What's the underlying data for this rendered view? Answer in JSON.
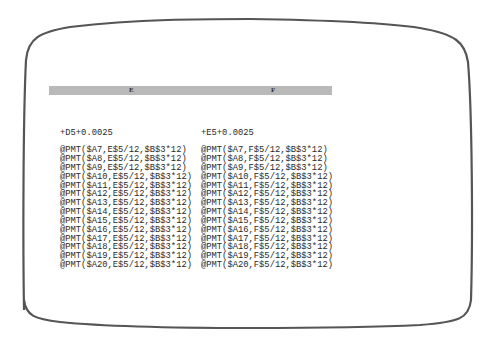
{
  "screen": {
    "bezel_color": "#555555",
    "header_bar_color": "#b9b9b9"
  },
  "columns": {
    "E": {
      "label": "E",
      "first": "+D5+0.0025",
      "rows": [
        "@PMT($A7,E$5/12,$B$3*12)",
        "@PMT($A8,E$5/12,$B$3*12)",
        "@PMT($A9,E$5/12,$B$3*12)",
        "@PMT($A10,E$5/12,$B$3*12)",
        "@PMT($A11,E$5/12,$B$3*12)",
        "@PMT($A12,E$5/12,$B$3*12)",
        "@PMT($A13,E$5/12,$B$3*12)",
        "@PMT($A14,E$5/12,$B$3*12)",
        "@PMT($A15,E$5/12,$B$3*12)",
        "@PMT($A16,E$5/12,$B$3*12)",
        "@PMT($A17,E$5/12,$B$3*12)",
        "@PMT($A18,E$5/12,$B$3*12)",
        "@PMT($A19,E$5/12,$B$3*12)",
        "@PMT($A20,E$5/12,$B$3*12)"
      ]
    },
    "F": {
      "label": "F",
      "first": "+E5+0.0025",
      "rows": [
        "@PMT($A7,F$5/12,$B$3*12)",
        "@PMT($A8,F$5/12,$B$3*12)",
        "@PMT($A9,F$5/12,$B$3*12)",
        "@PMT($A10,F$5/12,$B$3*12)",
        "@PMT($A11,F$5/12,$B$3*12)",
        "@PMT($A12,F$5/12,$B$3*12)",
        "@PMT($A13,F$5/12,$B$3*12)",
        "@PMT($A14,F$5/12,$B$3*12)",
        "@PMT($A15,F$5/12,$B$3*12)",
        "@PMT($A16,F$5/12,$B$3*12)",
        "@PMT($A17,F$5/12,$B$3*12)",
        "@PMT($A18,F$5/12,$B$3*12)",
        "@PMT($A19,F$5/12,$B$3*12)",
        "@PMT($A20,F$5/12,$B$3*12)"
      ]
    }
  }
}
